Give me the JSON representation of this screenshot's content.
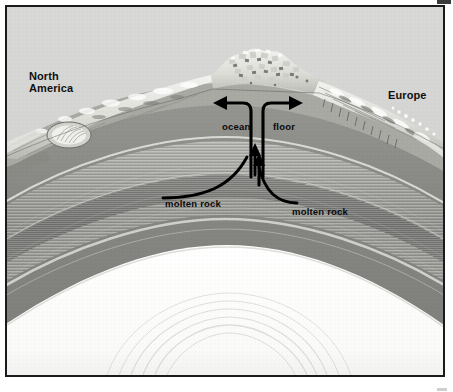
{
  "figure": {
    "type": "scientific-illustration-cross-section"
  },
  "labels": {
    "north_america": "North\nAmerica",
    "europe": "Europe",
    "ocean": "ocean",
    "floor": "floor",
    "molten_rock_left": "molten rock",
    "molten_rock_right": "molten rock"
  },
  "annotations": [
    {
      "name": "arrow-spreading-left",
      "direction": "left",
      "describes": "ocean floor moving west toward North America"
    },
    {
      "name": "arrow-spreading-right",
      "direction": "right",
      "describes": "ocean floor moving east toward Europe"
    },
    {
      "name": "arrow-molten-left",
      "direction": "up",
      "describes": "molten rock rising into the ridge"
    },
    {
      "name": "arrow-molten-right",
      "direction": "up",
      "describes": "molten rock rising into the ridge"
    }
  ],
  "colors": {
    "frame_border": "#1b1b1b",
    "page_background": "#ffffff",
    "water_background": "#d3d3d2",
    "crust_light": "#e9e9e6",
    "upper_mantle": "#8d8d8a",
    "mantle_band_dark": "#6f6f6d",
    "mantle_band_mid": "#9a9a97",
    "mantle_band_light": "#c0c0bc",
    "core": "#fbfbfa",
    "label_text": "#0a0a0a"
  },
  "layers": [
    {
      "name": "ocean-water",
      "tone": "light-gray"
    },
    {
      "name": "continental-shelf",
      "tone": "pale"
    },
    {
      "name": "oceanic-crust",
      "tone": "pale"
    },
    {
      "name": "upper-mantle",
      "tone": "medium-gray"
    },
    {
      "name": "banded-mantle",
      "tone": "striated-gray"
    },
    {
      "name": "lower-mantle",
      "tone": "medium-gray"
    },
    {
      "name": "core",
      "tone": "white"
    }
  ]
}
